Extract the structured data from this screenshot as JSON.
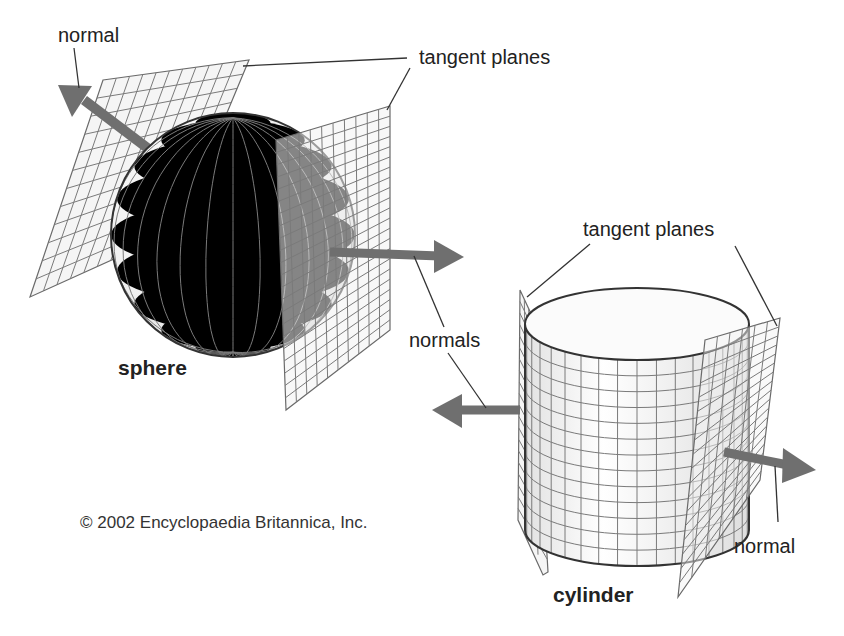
{
  "figure": {
    "labels": {
      "sphere_normal": "normal",
      "sphere_tangent_planes": "tangent planes",
      "sphere_normals": "normals",
      "sphere_name": "sphere",
      "cylinder_tangent_planes": "tangent planes",
      "cylinder_normal": "normal",
      "cylinder_name": "cylinder"
    },
    "copyright": "© 2002 Encyclopaedia Britannica, Inc."
  },
  "colors": {
    "background": "#ffffff",
    "arrow": "#6f6f6f",
    "grid_line": "#7a7a7a",
    "outline": "#333333",
    "text": "#222222"
  },
  "shapes": {
    "sphere": {
      "cx": 233,
      "cy": 235,
      "r": 122,
      "meridians": 14,
      "parallels": 10
    },
    "cylinder": {
      "cx": 637,
      "top_y": 324,
      "bottom_y": 530,
      "rx": 112,
      "ry": 36,
      "columns": 18,
      "rows": 13
    },
    "tangent_planes": 4,
    "normal_arrows": 4
  }
}
